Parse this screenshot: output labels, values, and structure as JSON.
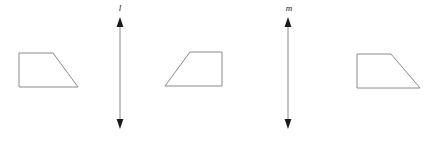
{
  "figure": {
    "background_color": "#ffffff",
    "stroke_color": "#8a8a8a",
    "label_color": "#1a1a1a",
    "canvas": {
      "width": 442,
      "height": 141
    },
    "shapes": [
      {
        "id": "trapezoid-1",
        "name": "left-trapezoid",
        "orientation": "right-leaning",
        "points": "19,53 53,53 78,87 19,87"
      },
      {
        "id": "trapezoid-2",
        "name": "middle-trapezoid",
        "orientation": "left-leaning",
        "points": "190,52 222,52 222,86 165,86"
      },
      {
        "id": "trapezoid-3",
        "name": "right-trapezoid",
        "orientation": "right-leaning",
        "points": "357,54 391,54 420,88 357,88"
      }
    ],
    "axes": [
      {
        "id": "line-l",
        "name": "reflection-line-l",
        "label": "l",
        "x": 120,
        "y_top": 20,
        "y_bottom": 126,
        "label_x": 120,
        "label_y": 11
      },
      {
        "id": "line-m",
        "name": "reflection-line-m",
        "label": "m",
        "x": 288,
        "y_top": 20,
        "y_bottom": 126,
        "label_x": 289,
        "label_y": 11
      }
    ]
  }
}
